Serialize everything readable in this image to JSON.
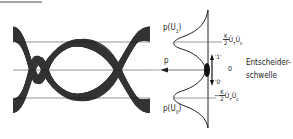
{
  "figure": {
    "type": "eye-diagram-with-probability-density",
    "top_rule": {
      "x1": 0,
      "x2": 42,
      "y": 2
    },
    "eye": {
      "x_start": 13,
      "x_end": 150,
      "upper_level_y": 42,
      "threshold_y": 70,
      "lower_level_y": 98,
      "crossings_x": [
        45,
        118
      ],
      "stroke_color": "#111111"
    },
    "density": {
      "axis_x": 208,
      "axis_top": 10,
      "axis_bottom": 128,
      "peak_depth_x": 173
    },
    "labels": {
      "p_u1_main": "p(U",
      "p_u1_sub": "1",
      "p_u1_close": ")",
      "p_u0_main": "p(U",
      "p_u0_sub": "0",
      "p_u0_close": ")",
      "p_axis": "p",
      "k_num": "K",
      "k_den": "2",
      "upper_level_tail": "Û",
      "upper_level_sub1": "T",
      "upper_level_u": "Û",
      "upper_level_sub2": "0",
      "lower_level_sign": "−",
      "zero": "0",
      "one_mark": "'1'",
      "zero_mark": "'0'",
      "threshold_line1": "Entscheider-",
      "threshold_line2": "schwelle"
    }
  }
}
